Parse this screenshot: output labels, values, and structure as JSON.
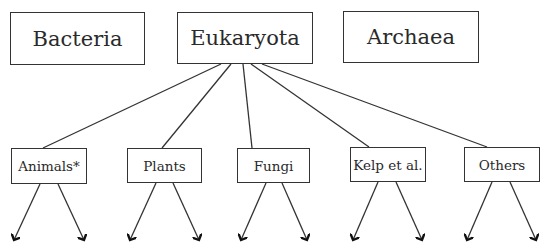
{
  "diagram": {
    "top_level": [
      {
        "id": "bacteria",
        "label": "Bacteria"
      },
      {
        "id": "eukaryota",
        "label": "Eukaryota"
      },
      {
        "id": "archaea",
        "label": "Archaea"
      }
    ],
    "eukaryota_children": [
      {
        "id": "animals",
        "label": "Animals*"
      },
      {
        "id": "plants",
        "label": "Plants"
      },
      {
        "id": "fungi",
        "label": "Fungi"
      },
      {
        "id": "kelp",
        "label": "Kelp et al."
      },
      {
        "id": "others",
        "label": "Others"
      }
    ],
    "edges": [
      [
        "eukaryota",
        "animals"
      ],
      [
        "eukaryota",
        "plants"
      ],
      [
        "eukaryota",
        "fungi"
      ],
      [
        "eukaryota",
        "kelp"
      ],
      [
        "eukaryota",
        "others"
      ]
    ],
    "child_arrows_per_node": 2
  }
}
